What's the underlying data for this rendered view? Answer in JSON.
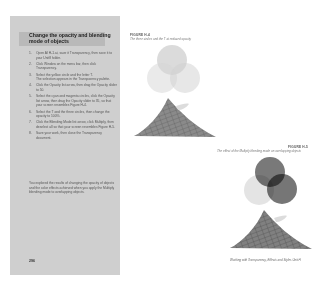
{
  "left_page": {
    "heading": "Change the opacity and blending mode of objects",
    "steps": [
      {
        "num": "1.",
        "text": "Open AI H-1.ai, save it Transparency, then save it to your Unit8 folder."
      },
      {
        "num": "2.",
        "text": "Click Window on the menu bar, then click Transparency."
      },
      {
        "num": "3.",
        "text": "Select the yellow circle and the letter T.",
        "sub": "The selection appears in the Transparency palette."
      },
      {
        "num": "4.",
        "text": "Click the Opacity list arrow, then drag the Opacity slider to 50."
      },
      {
        "num": "5.",
        "text": "Select the cyan and magenta circles, click the Opacity list arrow, then drag the Opacity slider to 35, so that your screen resembles Figure H-4."
      },
      {
        "num": "6.",
        "text": "Select the T and the three circles, then change the opacity to 100%."
      },
      {
        "num": "7.",
        "text": "Click the Blending Mode list arrow, click Multiply, then deselect all so that your screen resembles Figure H-5."
      },
      {
        "num": "8.",
        "text": "Save your work, then close the Transparency document."
      }
    ],
    "summary": "You explored the results of changing the opacity of objects and the color effects achieved when you apply the Multiply blending mode to overlapping objects.",
    "page_number": "296"
  },
  "right_page": {
    "figure_1": {
      "label": "FIGURE H-4",
      "caption": "The three circles and the T at reduced opacity"
    },
    "figure_2": {
      "label": "FIGURE H-5",
      "caption": "The effect of the Multiply blending mode on overlapping objects"
    },
    "footer": "Working with Transparency, Effects and Styles   Unit H"
  }
}
